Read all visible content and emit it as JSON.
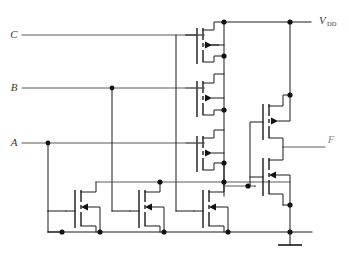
{
  "figure": {
    "kind": "cmos-complex-gate-schematic",
    "width": 349,
    "height": 263,
    "background": "#ffffff",
    "line_color": "#1a1a1a",
    "label_color": "#3a3a3a"
  },
  "labels": {
    "input_c": "C",
    "input_b": "B",
    "input_a": "A",
    "supply": "V",
    "supply_sub": "DD",
    "output": "F"
  },
  "nets": {
    "supply_name": "VDD",
    "ground_name": "GND",
    "internal_name": "X",
    "output_name": "F"
  },
  "devices": {
    "pmos_pullup": [
      {
        "id": "P1",
        "gate_input": "C",
        "type": "pmos"
      },
      {
        "id": "P2",
        "gate_input": "B",
        "type": "pmos"
      },
      {
        "id": "P3",
        "gate_input": "A",
        "type": "pmos"
      }
    ],
    "nmos_pulldown": [
      {
        "id": "N1",
        "gate_input": "A",
        "type": "nmos"
      },
      {
        "id": "N2",
        "gate_input": "B",
        "type": "nmos"
      },
      {
        "id": "N3",
        "gate_input": "C",
        "type": "nmos"
      }
    ],
    "output_inverter": [
      {
        "id": "P4",
        "gate_input": "X",
        "type": "pmos"
      },
      {
        "id": "N4",
        "gate_input": "X",
        "type": "nmos"
      }
    ]
  }
}
